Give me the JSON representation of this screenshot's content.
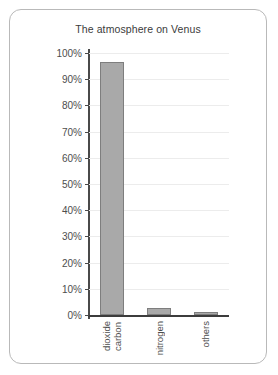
{
  "card": {
    "border_color": "#b9b9b9",
    "background": "#ffffff"
  },
  "chart_data": {
    "type": "bar",
    "title": "The atmosphere on Venus",
    "xlabel": "",
    "ylabel": "",
    "categories": [
      "carbon dioxide",
      "nitrogen",
      "others"
    ],
    "category_label_lines": [
      [
        "carbon",
        "dioxide"
      ],
      [
        "nitrogen"
      ],
      [
        "others"
      ]
    ],
    "values": [
      96.5,
      2.5,
      1.0
    ],
    "ylim": [
      0,
      100
    ],
    "ytick_step": 10,
    "ytick_labels": [
      "0%",
      "10%",
      "20%",
      "30%",
      "40%",
      "50%",
      "60%",
      "70%",
      "80%",
      "90%",
      "100%"
    ],
    "ytick_values": [
      0,
      10,
      20,
      30,
      40,
      50,
      60,
      70,
      80,
      90,
      100
    ],
    "grid": true,
    "legend": false,
    "bar_fill_color": "#a9a9a9",
    "bar_edge_color": "#7e7e7e",
    "gridline_color": "#ececec",
    "axis_color": "#4a4a4a"
  }
}
